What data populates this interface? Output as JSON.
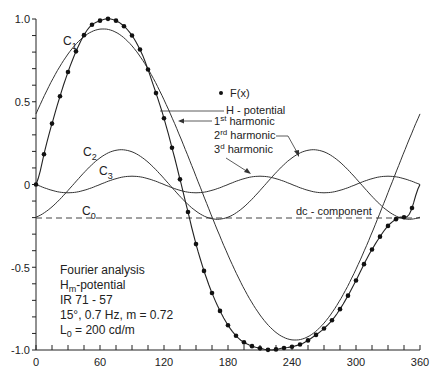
{
  "chart_data": {
    "type": "line",
    "title": "Fourier analysis",
    "xlabel": "",
    "ylabel": "",
    "xlim": [
      0,
      360
    ],
    "ylim": [
      -1.0,
      1.0
    ],
    "x_ticks": [
      0,
      60,
      120,
      180,
      240,
      300,
      360
    ],
    "y_ticks": [
      1.0,
      0.5,
      0,
      -0.5,
      -1.0
    ],
    "y_tick_labels": [
      "1.0",
      "0.5",
      "0",
      "-0.5",
      "-1.0"
    ],
    "grid": false,
    "series": [
      {
        "name": "F(x)",
        "style": "dots",
        "x": [
          0,
          10,
          20,
          30,
          40,
          50,
          60,
          70,
          80,
          90,
          100,
          110,
          120,
          130,
          140,
          150,
          160,
          170,
          180,
          190,
          200,
          210,
          220,
          230,
          240,
          250,
          260,
          270,
          280,
          290,
          300,
          310,
          320,
          330,
          340,
          350,
          360
        ],
        "values": [
          0.0,
          0.25,
          0.48,
          0.68,
          0.84,
          0.95,
          0.99,
          1.0,
          0.97,
          0.9,
          0.78,
          0.6,
          0.4,
          0.16,
          -0.1,
          -0.36,
          -0.57,
          -0.73,
          -0.85,
          -0.93,
          -0.97,
          -0.99,
          -1.0,
          -0.99,
          -0.98,
          -0.96,
          -0.92,
          -0.87,
          -0.8,
          -0.7,
          -0.58,
          -0.45,
          -0.34,
          -0.25,
          -0.2,
          -0.18,
          0.0
        ]
      },
      {
        "name": "H - potential",
        "style": "solid"
      },
      {
        "name": "C1 (1st harmonic)",
        "amplitude": 0.94,
        "phase_deg": 63
      },
      {
        "name": "C2 (2nd harmonic)",
        "amplitude": 0.21,
        "phase_deg": 80
      },
      {
        "name": "C3 (3rd harmonic)",
        "amplitude": 0.05,
        "phase_deg": 90
      },
      {
        "name": "C0 (dc - component)",
        "style": "dashed",
        "value": -0.2
      }
    ],
    "annotations": [
      "F(x)",
      "H - potential",
      "1st harmonic",
      "2rd harmonic",
      "3d harmonic",
      "dc - component"
    ]
  },
  "legend": {
    "fx": "F(x)",
    "h_potential": "H - potential",
    "first": "1",
    "first_sup": "st",
    "first_rest": " harmonic",
    "second": "2",
    "second_sup": "rd",
    "second_rest": " harmonic",
    "third": "3",
    "third_sup": "d",
    "third_rest": " harmonic",
    "dc": "dc - component"
  },
  "curve_labels": {
    "c1": "C",
    "c1_sub": "1",
    "c2": "C",
    "c2_sub": "2",
    "c3": "C",
    "c3_sub": "3",
    "c0": "C",
    "c0_sub": "0"
  },
  "info": {
    "line1": "Fourier analysis",
    "line2_main": "H",
    "line2_sub": "m",
    "line2_rest": "-potential",
    "line3": "IR  71 - 57",
    "line4": "15°,  0.7 Hz,  m = 0.72",
    "line5_main": "L",
    "line5_sub": "0",
    "line5_rest": " = 200 cd/m"
  },
  "axes": {
    "x_tick_labels": [
      "0",
      "60",
      "120",
      "180",
      "240",
      "300",
      "360"
    ],
    "y_tick_labels": [
      "1.0",
      "0.5",
      "0",
      "-0.5",
      "-1.0"
    ]
  }
}
